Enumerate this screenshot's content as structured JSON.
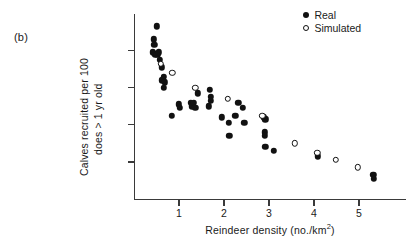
{
  "panel": {
    "label": "(b)"
  },
  "legend": {
    "position": "top-right",
    "entries": [
      {
        "label": "Real",
        "marker": "filled-circle-icon"
      },
      {
        "label": "Simulated",
        "marker": "open-circle-icon"
      }
    ]
  },
  "axes": {
    "x_title": "Reindeer density (no./km",
    "x_title_sup": "2",
    "x_title_close": ")",
    "y_title_line1": "Calves recruited per 100",
    "y_title_line2": "does > 1 yr old",
    "x_ticks": [
      "1",
      "2",
      "3",
      "4",
      "5"
    ],
    "y_ticks": [
      "",
      "",
      "",
      ""
    ]
  },
  "chart_data": {
    "type": "scatter",
    "title": "",
    "xlabel": "Reindeer density (no./km2)",
    "ylabel": "Calves recruited per 100 does > 1 yr old",
    "xlim": [
      0,
      6.0
    ],
    "ylim": [
      0,
      100
    ],
    "xticks": [
      1,
      2,
      3,
      4,
      5
    ],
    "yticks": [
      20,
      40,
      60,
      80
    ],
    "ytick_labels_shown": false,
    "grid": false,
    "legend_position": "top-right",
    "series": [
      {
        "name": "Real",
        "marker": "filled-circle",
        "points": [
          [
            0.5,
            93
          ],
          [
            0.44,
            86
          ],
          [
            0.45,
            83
          ],
          [
            0.42,
            79
          ],
          [
            0.47,
            78
          ],
          [
            0.52,
            78
          ],
          [
            0.55,
            79
          ],
          [
            0.58,
            75
          ],
          [
            0.62,
            71
          ],
          [
            0.66,
            66
          ],
          [
            0.63,
            64
          ],
          [
            0.68,
            63
          ],
          [
            0.66,
            60
          ],
          [
            0.84,
            45
          ],
          [
            1.0,
            51
          ],
          [
            1.02,
            49
          ],
          [
            1.26,
            52
          ],
          [
            1.28,
            50
          ],
          [
            1.33,
            52
          ],
          [
            1.36,
            49
          ],
          [
            1.42,
            57
          ],
          [
            1.68,
            59
          ],
          [
            1.7,
            55
          ],
          [
            1.71,
            53
          ],
          [
            1.66,
            50
          ],
          [
            1.95,
            44
          ],
          [
            2.1,
            41
          ],
          [
            2.12,
            34
          ],
          [
            2.25,
            45
          ],
          [
            2.32,
            52
          ],
          [
            2.42,
            49
          ],
          [
            2.45,
            41
          ],
          [
            2.88,
            44
          ],
          [
            2.92,
            43
          ],
          [
            2.9,
            36
          ],
          [
            2.9,
            34
          ],
          [
            2.92,
            28
          ],
          [
            3.1,
            26
          ],
          [
            4.08,
            23
          ],
          [
            5.32,
            13
          ],
          [
            5.33,
            11
          ]
        ]
      },
      {
        "name": "Simulated",
        "marker": "open-circle",
        "points": [
          [
            0.6,
            73
          ],
          [
            0.85,
            68
          ],
          [
            1.36,
            60
          ],
          [
            2.08,
            54
          ],
          [
            2.85,
            45
          ],
          [
            3.58,
            30
          ],
          [
            4.07,
            25
          ],
          [
            4.48,
            21
          ],
          [
            4.98,
            17
          ]
        ]
      }
    ]
  }
}
